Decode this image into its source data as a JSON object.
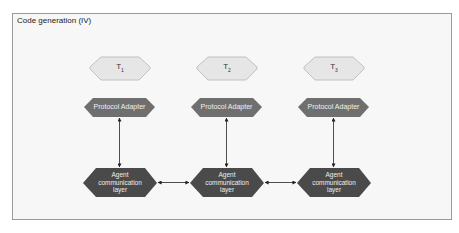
{
  "frame": {
    "title": "Code generation (IV)"
  },
  "colors": {
    "task_fill": "#e6e6e6",
    "task_stroke": "#b5b5b5",
    "adapter_fill": "#6f6f6f",
    "layer_fill": "#4a4a4a",
    "arrow": "#222222",
    "frame_bg": "#f7f7f7"
  },
  "columns": [
    {
      "task": {
        "label": "T",
        "subscript": "1"
      },
      "adapter": {
        "label": "Protocol Adapter"
      },
      "layer": {
        "line1": "Agent",
        "line2": "communication",
        "line3": "layer"
      }
    },
    {
      "task": {
        "label": "T",
        "subscript": "2"
      },
      "adapter": {
        "label": "Protocol Adapter"
      },
      "layer": {
        "line1": "Agent",
        "line2": "communication",
        "line3": "layer"
      }
    },
    {
      "task": {
        "label": "T",
        "subscript": "3"
      },
      "adapter": {
        "label": "Protocol Adapter"
      },
      "layer": {
        "line1": "Agent",
        "line2": "communication",
        "line3": "layer"
      }
    }
  ],
  "connections": [
    {
      "from": "adapter-1",
      "to": "layer-1",
      "type": "bidirectional"
    },
    {
      "from": "adapter-2",
      "to": "layer-2",
      "type": "bidirectional"
    },
    {
      "from": "adapter-3",
      "to": "layer-3",
      "type": "bidirectional"
    },
    {
      "from": "layer-1",
      "to": "layer-2",
      "type": "bidirectional"
    },
    {
      "from": "layer-2",
      "to": "layer-3",
      "type": "bidirectional"
    }
  ]
}
